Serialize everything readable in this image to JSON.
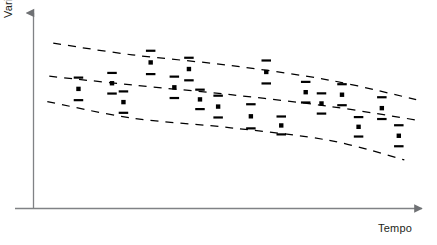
{
  "figure": {
    "title": "",
    "background_color": "#ffffff",
    "axis_color": "#808285",
    "marker_color": "#000000",
    "band_color": "#000000"
  },
  "axes": {
    "y_label": "Variável",
    "x_label": "Tempo",
    "y_axis_arrow": "arrow-up-icon",
    "x_axis_arrow": "arrow-right-icon",
    "x_ticks": [],
    "y_ticks": [],
    "grid": false
  },
  "chart_data": {
    "type": "scatter",
    "title": "",
    "subtitle": "",
    "xlabel": "Tempo",
    "ylabel": "Variável",
    "xlim": [
      0,
      100
    ],
    "ylim": [
      0,
      100
    ],
    "grid": false,
    "legend": null,
    "series": [
      {
        "name": "Medições",
        "marker": "error-bar-with-square",
        "points": [
          {
            "x": 11.4,
            "y": 61.5,
            "err": 5.8
          },
          {
            "x": 19.9,
            "y": 64.4,
            "err": 5.3
          },
          {
            "x": 22.8,
            "y": 54.7,
            "err": 5.5
          },
          {
            "x": 29.7,
            "y": 75.1,
            "err": 6.0
          },
          {
            "x": 35.7,
            "y": 62.3,
            "err": 5.5
          },
          {
            "x": 39.4,
            "y": 71.7,
            "err": 5.8
          },
          {
            "x": 42.2,
            "y": 56.1,
            "err": 5.0
          },
          {
            "x": 46.8,
            "y": 52.4,
            "err": 5.6
          },
          {
            "x": 55.1,
            "y": 47.4,
            "err": 6.2
          },
          {
            "x": 59.0,
            "y": 70.2,
            "err": 5.9
          },
          {
            "x": 62.8,
            "y": 42.7,
            "err": 4.6
          },
          {
            "x": 69.0,
            "y": 59.8,
            "err": 5.3
          },
          {
            "x": 73.0,
            "y": 54.0,
            "err": 5.2
          },
          {
            "x": 78.2,
            "y": 58.5,
            "err": 5.4
          },
          {
            "x": 82.4,
            "y": 42.0,
            "err": 5.0
          },
          {
            "x": 88.3,
            "y": 51.6,
            "err": 5.6
          },
          {
            "x": 92.6,
            "y": 37.4,
            "err": 5.4
          }
        ]
      }
    ],
    "bands": [
      {
        "name": "Limite superior",
        "style": "dashed",
        "points": [
          [
            5.0,
            85.0
          ],
          [
            25.0,
            79.0
          ],
          [
            50.0,
            73.5
          ],
          [
            75.0,
            66.0
          ],
          [
            97.0,
            56.0
          ]
        ]
      },
      {
        "name": "Tendência central",
        "style": "dashed",
        "points": [
          [
            4.0,
            68.0
          ],
          [
            25.0,
            63.5
          ],
          [
            50.0,
            58.5
          ],
          [
            75.0,
            52.5
          ],
          [
            97.0,
            45.5
          ]
        ]
      },
      {
        "name": "Limite inferior",
        "style": "dashed",
        "points": [
          [
            3.5,
            55.0
          ],
          [
            25.0,
            46.5
          ],
          [
            50.0,
            41.5
          ],
          [
            75.0,
            35.0
          ],
          [
            94.0,
            25.0
          ]
        ]
      }
    ]
  }
}
